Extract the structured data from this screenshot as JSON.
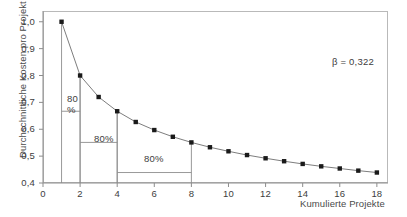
{
  "chart_data": {
    "type": "line",
    "title": "",
    "xlabel": "Kumulierte Projekte",
    "ylabel": "Durchschnittliche Kosten pro Projekt",
    "xlim": [
      0,
      18.6
    ],
    "ylim": [
      0.4,
      1.04
    ],
    "grid": false,
    "legend": null,
    "marker": "square",
    "x": [
      1,
      2,
      3,
      4,
      5,
      6,
      7,
      8,
      9,
      10,
      11,
      12,
      13,
      14,
      15,
      16,
      17,
      18
    ],
    "values": [
      1.0,
      0.8,
      0.72,
      0.667,
      0.627,
      0.597,
      0.572,
      0.551,
      0.533,
      0.518,
      0.504,
      0.492,
      0.481,
      0.471,
      0.462,
      0.454,
      0.446,
      0.439
    ],
    "series": [
      {
        "name": "Durchschnittliche Kosten pro Projekt",
        "values": [
          1.0,
          0.8,
          0.72,
          0.667,
          0.627,
          0.597,
          0.572,
          0.551,
          0.533,
          0.518,
          0.504,
          0.492,
          0.481,
          0.471,
          0.462,
          0.454,
          0.446,
          0.439
        ]
      }
    ],
    "xticks": [
      "0",
      "2",
      "4",
      "6",
      "8",
      "10",
      "12",
      "14",
      "16",
      "18"
    ],
    "xtick_values": [
      0,
      2,
      4,
      6,
      8,
      10,
      12,
      14,
      16,
      18
    ],
    "yticks": [
      "1,0",
      "0,9",
      "0,8",
      "0,7",
      "0,6",
      "0,5",
      "0,4"
    ],
    "ytick_values": [
      1.0,
      0.9,
      0.8,
      0.7,
      0.6,
      0.5,
      0.4
    ],
    "annotations": [
      {
        "text": "β = 0,322",
        "x": 16.0,
        "y": 0.93
      },
      {
        "text": "80",
        "sub": "%",
        "from_x": 1,
        "to_x": 2,
        "y": 0.667,
        "label_x": 1.3,
        "label_y": 0.63
      },
      {
        "text": "80%",
        "from_x": 2,
        "to_x": 4,
        "y": 0.551,
        "label_x": 2.7,
        "label_y": 0.5
      },
      {
        "text": "80%",
        "from_x": 4,
        "to_x": 8,
        "y": 0.439,
        "label_x": 5.2,
        "label_y": 0.455
      }
    ],
    "colors": {
      "line": "#6e6e6e",
      "marker": "#1a1a1a",
      "axis": "#8d8d8d",
      "frame": "#b9b9b9",
      "annotation_line": "#8d8d8d",
      "text": "#3d3d3d",
      "background": "#ffffff"
    }
  },
  "labels": {
    "y_axis_title": "Durchschnittliche Kosten pro Projekt",
    "x_axis_title": "Kumulierte Projekte",
    "beta": "β = 0,322",
    "ann1_top": "80",
    "ann1_bottom": "%",
    "ann2": "80%",
    "ann3": "80%"
  }
}
